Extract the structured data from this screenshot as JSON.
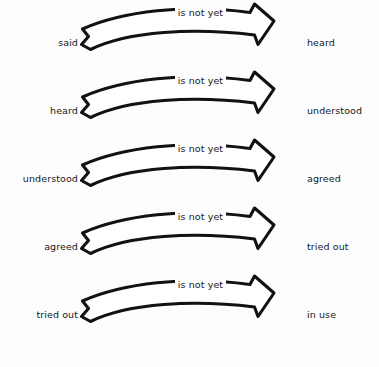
{
  "diagram": {
    "type": "sequential-arrow-chain",
    "title_text": "",
    "background_color": "#fdfdfd",
    "ink_color": "#101214",
    "edge_label_default": "is not yet",
    "arrow_icon_name": "curved-block-arrow",
    "rows": [
      {
        "from": "said",
        "to": "heard",
        "edge": "is not yet"
      },
      {
        "from": "heard",
        "to": "understood",
        "edge": "is not yet"
      },
      {
        "from": "understood",
        "to": "agreed",
        "edge": "is not yet"
      },
      {
        "from": "agreed",
        "to": "tried out",
        "edge": "is not yet"
      },
      {
        "from": "tried out",
        "to": "in use",
        "edge": "is not yet"
      }
    ]
  }
}
